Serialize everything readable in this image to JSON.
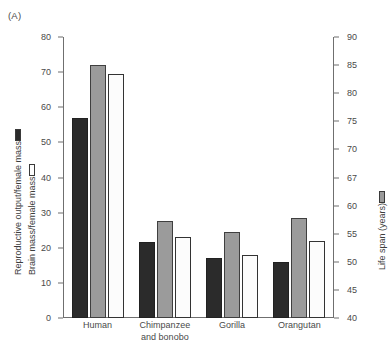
{
  "panel": {
    "label": "(A)"
  },
  "axes": {
    "left": {
      "title_primary": "Reproductive output/female mass",
      "title_primary_swatch": "dark-square-icon",
      "title_secondary": "Brain mass/female mass",
      "title_secondary_swatch": "white-square-icon",
      "ticks": [
        0,
        10,
        20,
        30,
        40,
        50,
        60,
        70,
        80
      ],
      "min": 0,
      "max": 80
    },
    "right": {
      "title": "Life span (years)",
      "title_swatch": "gray-square-icon",
      "ticks": [
        40,
        45,
        50,
        55,
        60,
        67,
        70,
        75,
        80,
        85,
        90
      ],
      "min": 40,
      "max": 90
    }
  },
  "colors": {
    "reproductive_output": "#2b2b2b",
    "life_span": "#9b9b9b",
    "brain_mass": "#fcfcfc",
    "axis": "#6f6f6f",
    "text": "#4a4a4a"
  },
  "chart_data": {
    "type": "bar",
    "title": "",
    "xlabel": "",
    "ylabel": "Reproductive output/female mass; Brain mass/female mass",
    "ylabel_right": "Life span (years)",
    "ylim": [
      0,
      80
    ],
    "ylim_right": [
      40,
      90
    ],
    "grid": false,
    "legend_position": "axis-titles",
    "categories": [
      "Human",
      "Chimpanzee\nand bonobo",
      "Gorilla",
      "Orangutan"
    ],
    "series": [
      {
        "name": "Reproductive output/female mass",
        "axis": "left",
        "color": "#2b2b2b",
        "values": [
          57,
          21.5,
          17,
          16
        ]
      },
      {
        "name": "Life span (years)",
        "axis": "right",
        "color": "#9b9b9b",
        "values": [
          72,
          27.5,
          24.5,
          28.5
        ],
        "values_in_years": [
          85,
          57.5,
          55.5,
          58
        ]
      },
      {
        "name": "Brain mass/female mass",
        "axis": "left",
        "color": "#fcfcfc",
        "values": [
          69.5,
          23,
          18,
          22
        ]
      }
    ]
  }
}
